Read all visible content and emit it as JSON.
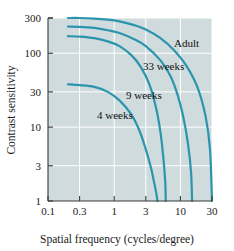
{
  "chart_data": {
    "type": "line",
    "title": "",
    "xlabel": "Spatial frequency (cycles/degree)",
    "ylabel": "Contrast sensitivity",
    "xscale": "log",
    "yscale": "log",
    "xlim": [
      0.1,
      30
    ],
    "ylim": [
      1,
      300
    ],
    "xticks": [
      "0.1",
      "0.3",
      "1",
      "3",
      "10",
      "30"
    ],
    "xtick_values": [
      0.1,
      0.3,
      1,
      3,
      10,
      30
    ],
    "yticks": [
      "300",
      "100",
      "30",
      "10",
      "3",
      "1"
    ],
    "ytick_values": [
      300,
      100,
      30,
      10,
      3,
      1
    ],
    "grid": true,
    "legend": "inline-annotations",
    "line_color": "#2a95ad",
    "plot_background": "#cfdbdd",
    "grid_color": "#ffffff",
    "series": [
      {
        "name": "Adult",
        "label": "Adult",
        "x": [
          0.2,
          0.3,
          0.5,
          0.8,
          1.2,
          2,
          3,
          5,
          8,
          12,
          18,
          24,
          28,
          30
        ],
        "y": [
          300,
          300,
          295,
          285,
          270,
          240,
          210,
          160,
          110,
          70,
          35,
          14,
          5,
          1
        ]
      },
      {
        "name": "33 weeks",
        "label": "33 weeks",
        "x": [
          0.2,
          0.3,
          0.5,
          0.8,
          1.2,
          2,
          3,
          5,
          7,
          9,
          11,
          13,
          14.5,
          15
        ],
        "y": [
          230,
          228,
          220,
          205,
          188,
          155,
          125,
          80,
          50,
          28,
          14,
          6,
          2.4,
          1
        ]
      },
      {
        "name": "9 weeks",
        "label": "9 weeks",
        "x": [
          0.2,
          0.3,
          0.5,
          0.8,
          1.2,
          1.8,
          2.5,
          3.4,
          4.3,
          5,
          5.5,
          5.9,
          6
        ],
        "y": [
          170,
          168,
          160,
          145,
          125,
          95,
          66,
          38,
          18,
          8.5,
          4,
          1.8,
          1
        ]
      },
      {
        "name": "4 weeks",
        "label": "4 weeks",
        "x": [
          0.2,
          0.3,
          0.5,
          0.8,
          1.2,
          1.8,
          2.4,
          3,
          3.6,
          4,
          4.3,
          4.5
        ],
        "y": [
          38,
          37,
          35,
          30,
          23,
          15,
          9,
          5,
          2.8,
          1.8,
          1.3,
          1
        ]
      }
    ],
    "annotations": [
      {
        "text": "Adult",
        "x_px": 174,
        "y_px": 47
      },
      {
        "text": "33 weeks",
        "x_px": 143,
        "y_px": 70
      },
      {
        "text": "9 weeks",
        "x_px": 126,
        "y_px": 99
      },
      {
        "text": "4 weeks",
        "x_px": 97,
        "y_px": 119
      }
    ]
  },
  "axes": {
    "x_title": "Spatial frequency (cycles/degree)",
    "y_title": "Contrast sensitivity"
  }
}
